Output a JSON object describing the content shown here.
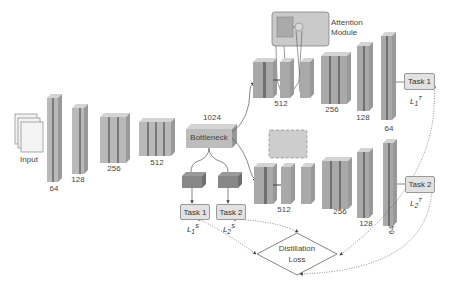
{
  "input_label": "Input",
  "encoder_labels": [
    "64",
    "128",
    "256",
    "512"
  ],
  "bottleneck": {
    "label": "Bottleneck",
    "size": "1024"
  },
  "attention": {
    "line1": "Attention",
    "line2": "Module"
  },
  "teacher_top": {
    "labels": [
      "512",
      "256",
      "128",
      "64"
    ],
    "task": "Task 1",
    "loss": "L",
    "loss_sub": "1",
    "loss_sup": "T"
  },
  "teacher_bottom": {
    "labels": [
      "512",
      "256",
      "128",
      "64"
    ],
    "task": "Task 2",
    "loss": "L",
    "loss_sub": "2",
    "loss_sup": "T"
  },
  "student": {
    "task1": "Task 1",
    "task2": "Task 2",
    "loss1_sub": "1",
    "loss2_sub": "2",
    "loss_sup": "S",
    "loss": "L"
  },
  "distillation": {
    "line1": "Distillation",
    "line2": "Loss"
  },
  "colors": {
    "block_face": "#b9b9b9",
    "block_dark": "#7a7a7a",
    "block_top": "#d4d4d4",
    "task_fill": "#e2e2e2",
    "attn_fill": "#c8c8c8"
  }
}
